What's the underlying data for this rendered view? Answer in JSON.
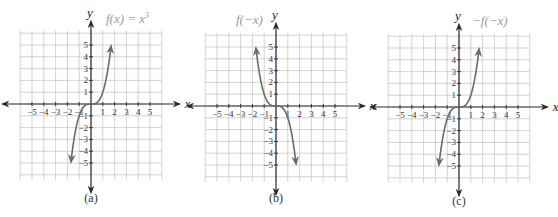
{
  "chart_data": [
    {
      "type": "line",
      "panel": "a",
      "title": "f(x) = x³",
      "caption": "(a)",
      "xlabel": "x",
      "ylabel": "y",
      "xlim": [
        -5,
        5
      ],
      "ylim": [
        -5,
        5
      ],
      "grid": true,
      "xticks": [
        -5,
        -4,
        -3,
        -2,
        -1,
        1,
        2,
        3,
        4,
        5
      ],
      "yticks": [
        -5,
        -4,
        -3,
        -2,
        -1,
        1,
        2,
        3,
        4,
        5
      ],
      "function": "x^3",
      "x": [
        -1.7,
        -1.5,
        -1,
        -0.5,
        0,
        0.5,
        1,
        1.5,
        1.7
      ],
      "y": [
        -4.913,
        -3.375,
        -1,
        -0.125,
        0,
        0.125,
        1,
        3.375,
        4.913
      ]
    },
    {
      "type": "line",
      "panel": "b",
      "title": "f(−x)",
      "caption": "(b)",
      "xlabel": "x",
      "ylabel": "y",
      "xlim": [
        -5,
        5
      ],
      "ylim": [
        -5,
        5
      ],
      "grid": true,
      "xticks": [
        -5,
        -4,
        -3,
        -2,
        -1,
        1,
        2,
        3,
        4,
        5
      ],
      "yticks": [
        -5,
        -4,
        -3,
        -2,
        -1,
        1,
        2,
        3,
        4,
        5
      ],
      "function": "(-x)^3",
      "x": [
        -1.7,
        -1.5,
        -1,
        -0.5,
        0,
        0.5,
        1,
        1.5,
        1.7
      ],
      "y": [
        4.913,
        3.375,
        1,
        0.125,
        0,
        -0.125,
        -1,
        -3.375,
        -4.913
      ]
    },
    {
      "type": "line",
      "panel": "c",
      "title": "−f(−x)",
      "caption": "(c)",
      "xlabel": "x",
      "ylabel": "y",
      "xlim": [
        -5,
        5
      ],
      "ylim": [
        -5,
        5
      ],
      "grid": true,
      "xticks": [
        -5,
        -4,
        -3,
        -2,
        -1,
        1,
        2,
        3,
        4,
        5
      ],
      "yticks": [
        -5,
        -4,
        -3,
        -2,
        -1,
        1,
        2,
        3,
        4,
        5
      ],
      "function": "-(-x)^3",
      "x": [
        -1.7,
        -1.5,
        -1,
        -0.5,
        0,
        0.5,
        1,
        1.5,
        1.7
      ],
      "y": [
        -4.913,
        -3.375,
        -1,
        -0.125,
        0,
        0.125,
        1,
        3.375,
        4.913
      ]
    }
  ],
  "panels": [
    {
      "id": "a",
      "label": "f(x) = x",
      "sup": "3",
      "caption": "(a)",
      "cx": 91,
      "cy": 104,
      "unit": 11.8,
      "labelX": 106,
      "labelY": 23,
      "captionY": 202,
      "sign": 1
    },
    {
      "id": "b",
      "label": "f(−x)",
      "sup": "",
      "caption": "(b)",
      "cx": 276,
      "cy": 106,
      "unit": 11.8,
      "labelX": 236,
      "labelY": 24,
      "captionY": 202,
      "sign": -1
    },
    {
      "id": "c",
      "label": "−f(−x)",
      "sup": "",
      "caption": "(c)",
      "cx": 459,
      "cy": 107,
      "unit": 11.8,
      "labelX": 472,
      "labelY": 25,
      "captionY": 205,
      "sign": 1
    }
  ],
  "axis_labels": {
    "x": "x",
    "y": "y"
  },
  "colors": {
    "curve": "#6b6b6b",
    "grid": "#c8c8c8",
    "axis": "#2b2b2b",
    "fnlabel": "#9a9a9a"
  }
}
